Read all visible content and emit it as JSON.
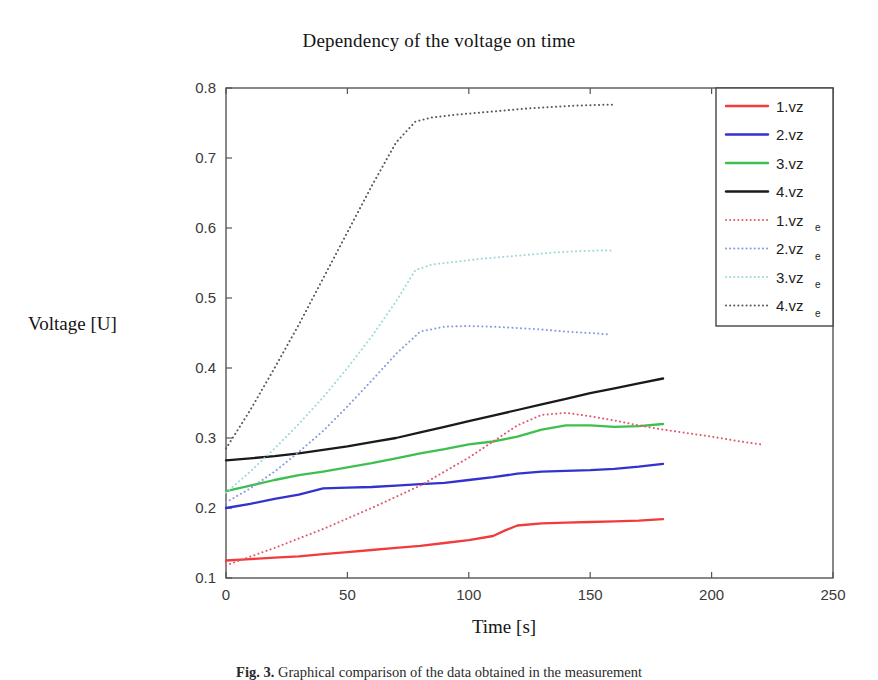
{
  "figure": {
    "title": "Dependency of the voltage on time",
    "caption_prefix": "Fig. 3.",
    "caption_text": "Graphical comparison of the data obtained in the measurement"
  },
  "axes": {
    "xlabel": "Time [s]",
    "ylabel": "Voltage [U]",
    "xticks": [
      "0",
      "50",
      "100",
      "150",
      "200",
      "250"
    ],
    "yticks": [
      "0.1",
      "0.2",
      "0.3",
      "0.4",
      "0.5",
      "0.6",
      "0.7",
      "0.8"
    ],
    "xlim": [
      0,
      250
    ],
    "ylim": [
      0.1,
      0.8
    ],
    "grid": false
  },
  "colors": {
    "series1": "#f03c3c",
    "series2": "#3333cc",
    "series3": "#3fbf4f",
    "series4": "#1a1a1a",
    "series1_e": "#e05a6e",
    "series2_e": "#8a9ade",
    "series3_e": "#9fd8d8",
    "series4_e": "#5a5a5a",
    "axis": "#555555",
    "background": "#ffffff"
  },
  "chart_data": {
    "type": "line",
    "title": "Dependency of the voltage on time",
    "xlabel": "Time [s]",
    "ylabel": "Voltage [U]",
    "xlim": [
      0,
      250
    ],
    "ylim": [
      0.1,
      0.8
    ],
    "grid": false,
    "legend_position": "top-right",
    "series": [
      {
        "name": "1.vz",
        "style": "solid",
        "color": "#f03c3c",
        "x": [
          0,
          10,
          20,
          30,
          40,
          50,
          60,
          70,
          80,
          90,
          100,
          110,
          115,
          120,
          130,
          140,
          150,
          160,
          170,
          180
        ],
        "y": [
          0.125,
          0.127,
          0.129,
          0.131,
          0.134,
          0.137,
          0.14,
          0.143,
          0.146,
          0.15,
          0.154,
          0.16,
          0.168,
          0.175,
          0.178,
          0.179,
          0.18,
          0.181,
          0.182,
          0.184
        ]
      },
      {
        "name": "2.vz",
        "style": "solid",
        "color": "#3333cc",
        "x": [
          0,
          10,
          20,
          30,
          40,
          50,
          60,
          70,
          80,
          90,
          100,
          110,
          120,
          130,
          140,
          150,
          160,
          170,
          180
        ],
        "y": [
          0.2,
          0.206,
          0.213,
          0.219,
          0.228,
          0.229,
          0.23,
          0.232,
          0.234,
          0.236,
          0.24,
          0.244,
          0.249,
          0.252,
          0.253,
          0.254,
          0.256,
          0.259,
          0.263
        ]
      },
      {
        "name": "3.vz",
        "style": "solid",
        "color": "#3fbf4f",
        "x": [
          0,
          10,
          20,
          30,
          40,
          50,
          60,
          70,
          80,
          90,
          100,
          110,
          120,
          130,
          140,
          150,
          160,
          170,
          180
        ],
        "y": [
          0.224,
          0.232,
          0.24,
          0.247,
          0.252,
          0.258,
          0.264,
          0.271,
          0.278,
          0.284,
          0.291,
          0.295,
          0.302,
          0.312,
          0.318,
          0.318,
          0.316,
          0.317,
          0.32
        ]
      },
      {
        "name": "4.vz",
        "style": "solid",
        "color": "#1a1a1a",
        "x": [
          0,
          10,
          20,
          30,
          40,
          50,
          60,
          70,
          80,
          90,
          100,
          110,
          120,
          130,
          140,
          150,
          160,
          170,
          180
        ],
        "y": [
          0.268,
          0.271,
          0.274,
          0.278,
          0.283,
          0.288,
          0.294,
          0.3,
          0.308,
          0.316,
          0.324,
          0.332,
          0.34,
          0.348,
          0.356,
          0.364,
          0.371,
          0.378,
          0.385
        ]
      },
      {
        "name": "1.vz_e",
        "style": "dotted",
        "color": "#e05a6e",
        "x": [
          0,
          20,
          40,
          60,
          80,
          100,
          110,
          120,
          130,
          140,
          150,
          160,
          170,
          180,
          190,
          200,
          210,
          220
        ],
        "y": [
          0.118,
          0.143,
          0.17,
          0.2,
          0.232,
          0.272,
          0.295,
          0.318,
          0.333,
          0.336,
          0.331,
          0.325,
          0.318,
          0.312,
          0.307,
          0.302,
          0.296,
          0.291
        ]
      },
      {
        "name": "2.vz_e",
        "style": "dotted",
        "color": "#8a9ade",
        "x": [
          0,
          10,
          20,
          30,
          40,
          50,
          60,
          70,
          80,
          90,
          100,
          110,
          120,
          130,
          140,
          150,
          158
        ],
        "y": [
          0.208,
          0.228,
          0.252,
          0.28,
          0.31,
          0.345,
          0.382,
          0.42,
          0.452,
          0.459,
          0.46,
          0.459,
          0.457,
          0.455,
          0.452,
          0.45,
          0.448
        ]
      },
      {
        "name": "3.vz_e",
        "style": "dotted",
        "color": "#9fd8d8",
        "x": [
          0,
          10,
          20,
          30,
          40,
          50,
          60,
          70,
          78,
          85,
          95,
          105,
          115,
          125,
          135,
          145,
          155,
          160
        ],
        "y": [
          0.222,
          0.252,
          0.285,
          0.32,
          0.358,
          0.4,
          0.445,
          0.495,
          0.54,
          0.548,
          0.552,
          0.556,
          0.559,
          0.562,
          0.565,
          0.567,
          0.568,
          0.568
        ]
      },
      {
        "name": "4.vz_e",
        "style": "dotted",
        "color": "#5a5a5a",
        "x": [
          0,
          10,
          20,
          30,
          40,
          50,
          60,
          70,
          78,
          85,
          95,
          105,
          115,
          125,
          135,
          145,
          155,
          160
        ],
        "y": [
          0.285,
          0.34,
          0.4,
          0.462,
          0.528,
          0.594,
          0.66,
          0.722,
          0.752,
          0.758,
          0.762,
          0.765,
          0.768,
          0.771,
          0.773,
          0.775,
          0.776,
          0.776
        ]
      }
    ]
  },
  "legend": {
    "items": [
      {
        "label": "1.vz",
        "sub": "",
        "color": "#f03c3c",
        "style": "solid"
      },
      {
        "label": "2.vz",
        "sub": "",
        "color": "#3333cc",
        "style": "solid"
      },
      {
        "label": "3.vz",
        "sub": "",
        "color": "#3fbf4f",
        "style": "solid"
      },
      {
        "label": "4.vz",
        "sub": "",
        "color": "#1a1a1a",
        "style": "solid"
      },
      {
        "label": "1.vz",
        "sub": "e",
        "color": "#e05a6e",
        "style": "dotted"
      },
      {
        "label": "2.vz",
        "sub": "e",
        "color": "#8a9ade",
        "style": "dotted"
      },
      {
        "label": "3.vz",
        "sub": "e",
        "color": "#9fd8d8",
        "style": "dotted"
      },
      {
        "label": "4.vz",
        "sub": "e",
        "color": "#5a5a5a",
        "style": "dotted"
      }
    ]
  }
}
